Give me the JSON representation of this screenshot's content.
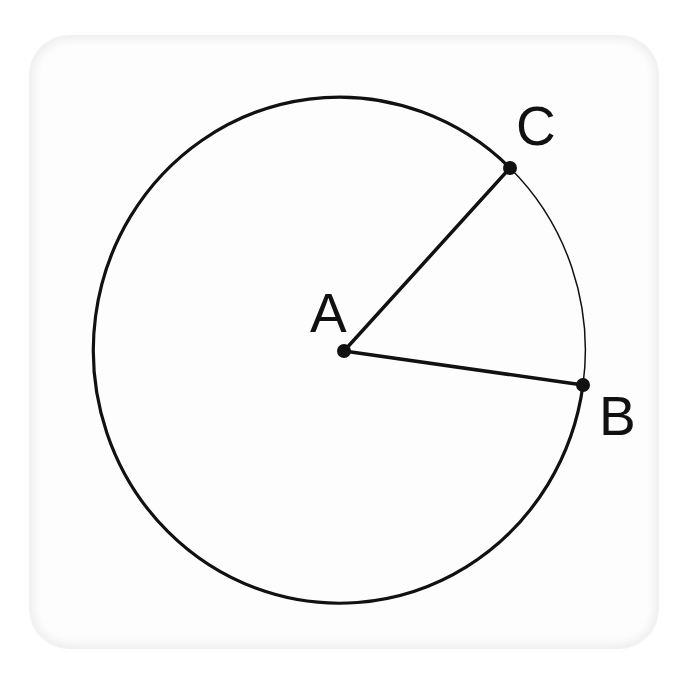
{
  "diagram": {
    "type": "circle-sector",
    "colors": {
      "stroke": "#111111",
      "background": "#ffffff",
      "card": "#fdfdfd"
    },
    "circle": {
      "center_label": "A",
      "cx": 343,
      "cy": 351,
      "rx": 246,
      "ry": 253,
      "stroke_width": 3.2,
      "minor_arc_stroke_width": 1.5
    },
    "points": [
      {
        "id": "A",
        "label": "A",
        "x": 344,
        "y": 351,
        "label_x": 310,
        "label_y": 332
      },
      {
        "id": "B",
        "label": "B",
        "x": 583,
        "y": 385,
        "label_x": 599,
        "label_y": 435
      },
      {
        "id": "C",
        "label": "C",
        "x": 510,
        "y": 168,
        "label_x": 516,
        "label_y": 145
      }
    ],
    "segments": [
      {
        "from": "A",
        "to": "C",
        "name": "radius-AC"
      },
      {
        "from": "A",
        "to": "B",
        "name": "radius-AB"
      }
    ],
    "arcs": [
      {
        "from": "C",
        "to": "B",
        "name": "minor-arc-CB",
        "style": "thin"
      },
      {
        "from": "B",
        "to": "C",
        "name": "major-arc-BC",
        "style": "thick"
      }
    ]
  }
}
